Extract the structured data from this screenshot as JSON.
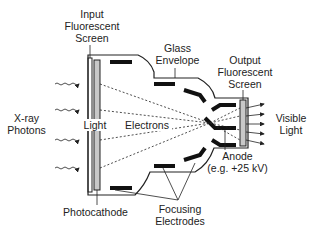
{
  "labels": {
    "input_screen": [
      "Input",
      "Fluorescent",
      "Screen"
    ],
    "glass_envelope": [
      "Glass",
      "Envelope"
    ],
    "output_screen": [
      "Output",
      "Fluorescent",
      "Screen"
    ],
    "xray_photons": [
      "X-ray",
      "Photons"
    ],
    "light": "Light",
    "electrons": "Electrons",
    "visible_light": [
      "Visible",
      "Light"
    ],
    "anode": [
      "Anode",
      "(e.g. +25 kV)"
    ],
    "photocathode": "Photocathode",
    "focusing_electrodes": [
      "Focusing",
      "Electrodes"
    ]
  },
  "colors": {
    "line": "#222222",
    "screen_fill": "#c8c8c8",
    "electrode": "#111111"
  }
}
